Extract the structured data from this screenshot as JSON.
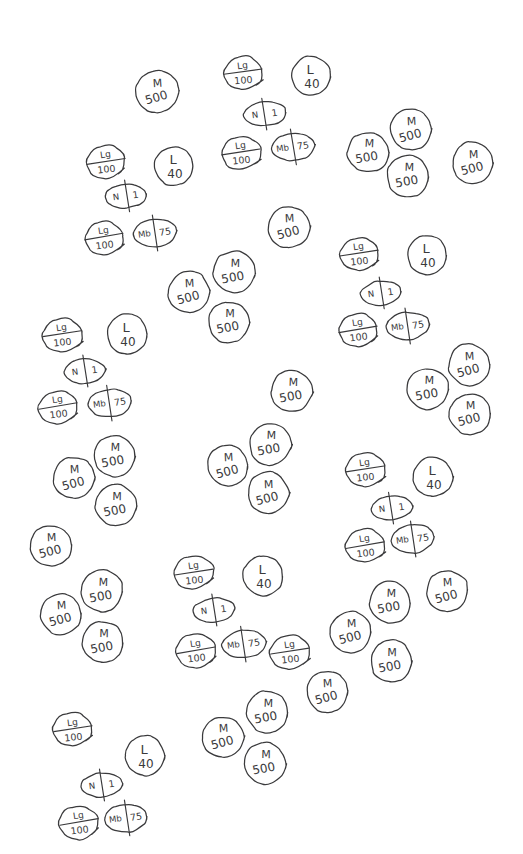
{
  "page": {
    "background_color": "#ffffff",
    "ink_color": "#3a3a3c",
    "width": 523,
    "height": 854
  },
  "token_types": {
    "m500": {
      "id": "m500",
      "shape": "circle",
      "top_label": "M",
      "bottom_label": "500"
    },
    "lg100": {
      "id": "lg100",
      "shape": "hexagon",
      "top_label": "Lg",
      "bottom_label": "100"
    },
    "l40": {
      "id": "l40",
      "shape": "circle",
      "top_label": "L",
      "bottom_label": "40"
    },
    "n1": {
      "id": "n1",
      "shape": "oval",
      "left_label": "N",
      "right_label": "1"
    },
    "mb75": {
      "id": "mb75",
      "shape": "oval",
      "left_label": "Mb",
      "right_label": "75"
    }
  },
  "legend": [
    {
      "type": "m500",
      "label": "M 500",
      "count": 33
    },
    {
      "type": "lg100",
      "label": "Lg 100",
      "count": 13
    },
    {
      "type": "l40",
      "label": "L 40",
      "count": 6
    },
    {
      "type": "n1",
      "label": "N 1",
      "count": 6
    },
    {
      "type": "mb75",
      "label": "Mb 75",
      "count": 6
    }
  ],
  "tokens": [
    {
      "type": "m500",
      "x": 157,
      "y": 92,
      "rx": 22,
      "ry": 21,
      "rot": -4
    },
    {
      "type": "lg100",
      "x": 243,
      "y": 73,
      "rx": 21,
      "ry": 18,
      "rot": -3
    },
    {
      "type": "l40",
      "x": 311,
      "y": 76,
      "rx": 20,
      "ry": 20,
      "rot": 0
    },
    {
      "type": "n1",
      "x": 265,
      "y": 114,
      "rx": 21,
      "ry": 12,
      "rot": -5
    },
    {
      "type": "lg100",
      "x": 241,
      "y": 153,
      "rx": 21,
      "ry": 18,
      "rot": -4
    },
    {
      "type": "mb75",
      "x": 293,
      "y": 147,
      "rx": 22,
      "ry": 14,
      "rot": -6
    },
    {
      "type": "m500",
      "x": 368,
      "y": 152,
      "rx": 21,
      "ry": 20,
      "rot": 3
    },
    {
      "type": "m500",
      "x": 411,
      "y": 130,
      "rx": 21,
      "ry": 21,
      "rot": -3
    },
    {
      "type": "m500",
      "x": 408,
      "y": 176,
      "rx": 21,
      "ry": 21,
      "rot": 2
    },
    {
      "type": "m500",
      "x": 473,
      "y": 163,
      "rx": 21,
      "ry": 21,
      "rot": -2
    },
    {
      "type": "lg100",
      "x": 106,
      "y": 162,
      "rx": 21,
      "ry": 18,
      "rot": -4
    },
    {
      "type": "l40",
      "x": 174,
      "y": 166,
      "rx": 20,
      "ry": 20,
      "rot": 0
    },
    {
      "type": "n1",
      "x": 126,
      "y": 196,
      "rx": 21,
      "ry": 12,
      "rot": -5
    },
    {
      "type": "lg100",
      "x": 104,
      "y": 238,
      "rx": 21,
      "ry": 18,
      "rot": -5
    },
    {
      "type": "mb75",
      "x": 155,
      "y": 233,
      "rx": 22,
      "ry": 14,
      "rot": -5
    },
    {
      "type": "m500",
      "x": 289,
      "y": 227,
      "rx": 21,
      "ry": 21,
      "rot": -3
    },
    {
      "type": "m500",
      "x": 234,
      "y": 272,
      "rx": 21,
      "ry": 21,
      "rot": 2
    },
    {
      "type": "m500",
      "x": 189,
      "y": 292,
      "rx": 21,
      "ry": 21,
      "rot": -3
    },
    {
      "type": "m500",
      "x": 229,
      "y": 322,
      "rx": 21,
      "ry": 21,
      "rot": 1
    },
    {
      "type": "lg100",
      "x": 359,
      "y": 254,
      "rx": 21,
      "ry": 18,
      "rot": -4
    },
    {
      "type": "l40",
      "x": 427,
      "y": 255,
      "rx": 20,
      "ry": 20,
      "rot": 0
    },
    {
      "type": "n1",
      "x": 381,
      "y": 293,
      "rx": 21,
      "ry": 12,
      "rot": -5
    },
    {
      "type": "lg100",
      "x": 358,
      "y": 330,
      "rx": 21,
      "ry": 18,
      "rot": -5
    },
    {
      "type": "mb75",
      "x": 408,
      "y": 326,
      "rx": 22,
      "ry": 14,
      "rot": -5
    },
    {
      "type": "m500",
      "x": 469,
      "y": 365,
      "rx": 21,
      "ry": 21,
      "rot": -3
    },
    {
      "type": "m500",
      "x": 428,
      "y": 389,
      "rx": 21,
      "ry": 21,
      "rot": 2
    },
    {
      "type": "m500",
      "x": 470,
      "y": 414,
      "rx": 21,
      "ry": 21,
      "rot": -2
    },
    {
      "type": "m500",
      "x": 292,
      "y": 391,
      "rx": 21,
      "ry": 21,
      "rot": 2
    },
    {
      "type": "lg100",
      "x": 62,
      "y": 335,
      "rx": 21,
      "ry": 18,
      "rot": -4
    },
    {
      "type": "l40",
      "x": 127,
      "y": 334,
      "rx": 20,
      "ry": 20,
      "rot": 0
    },
    {
      "type": "n1",
      "x": 85,
      "y": 371,
      "rx": 21,
      "ry": 12,
      "rot": -5
    },
    {
      "type": "lg100",
      "x": 58,
      "y": 407,
      "rx": 21,
      "ry": 18,
      "rot": -5
    },
    {
      "type": "mb75",
      "x": 110,
      "y": 403,
      "rx": 22,
      "ry": 14,
      "rot": -5
    },
    {
      "type": "m500",
      "x": 114,
      "y": 456,
      "rx": 21,
      "ry": 21,
      "rot": 2
    },
    {
      "type": "m500",
      "x": 74,
      "y": 478,
      "rx": 21,
      "ry": 21,
      "rot": -3
    },
    {
      "type": "m500",
      "x": 116,
      "y": 505,
      "rx": 21,
      "ry": 21,
      "rot": 1
    },
    {
      "type": "m500",
      "x": 51,
      "y": 546,
      "rx": 21,
      "ry": 21,
      "rot": -2
    },
    {
      "type": "m500",
      "x": 102,
      "y": 591,
      "rx": 21,
      "ry": 21,
      "rot": 2
    },
    {
      "type": "m500",
      "x": 61,
      "y": 614,
      "rx": 21,
      "ry": 21,
      "rot": -3
    },
    {
      "type": "m500",
      "x": 103,
      "y": 642,
      "rx": 21,
      "ry": 21,
      "rot": 1
    },
    {
      "type": "m500",
      "x": 228,
      "y": 466,
      "rx": 21,
      "ry": 21,
      "rot": -3
    },
    {
      "type": "m500",
      "x": 270,
      "y": 444,
      "rx": 21,
      "ry": 21,
      "rot": 2
    },
    {
      "type": "m500",
      "x": 268,
      "y": 493,
      "rx": 21,
      "ry": 21,
      "rot": -2
    },
    {
      "type": "lg100",
      "x": 365,
      "y": 470,
      "rx": 21,
      "ry": 18,
      "rot": -4
    },
    {
      "type": "l40",
      "x": 433,
      "y": 477,
      "rx": 20,
      "ry": 20,
      "rot": 0
    },
    {
      "type": "n1",
      "x": 392,
      "y": 508,
      "rx": 21,
      "ry": 12,
      "rot": -5
    },
    {
      "type": "lg100",
      "x": 365,
      "y": 546,
      "rx": 21,
      "ry": 18,
      "rot": -5
    },
    {
      "type": "mb75",
      "x": 413,
      "y": 539,
      "rx": 22,
      "ry": 14,
      "rot": -5
    },
    {
      "type": "m500",
      "x": 447,
      "y": 591,
      "rx": 21,
      "ry": 21,
      "rot": -3
    },
    {
      "type": "m500",
      "x": 390,
      "y": 602,
      "rx": 21,
      "ry": 21,
      "rot": 2
    },
    {
      "type": "m500",
      "x": 351,
      "y": 632,
      "rx": 21,
      "ry": 21,
      "rot": -2
    },
    {
      "type": "m500",
      "x": 391,
      "y": 661,
      "rx": 21,
      "ry": 21,
      "rot": 1
    },
    {
      "type": "m500",
      "x": 327,
      "y": 692,
      "rx": 21,
      "ry": 21,
      "rot": -3
    },
    {
      "type": "lg100",
      "x": 194,
      "y": 573,
      "rx": 21,
      "ry": 18,
      "rot": -4
    },
    {
      "type": "l40",
      "x": 263,
      "y": 576,
      "rx": 20,
      "ry": 20,
      "rot": 0
    },
    {
      "type": "n1",
      "x": 214,
      "y": 610,
      "rx": 21,
      "ry": 12,
      "rot": -5
    },
    {
      "type": "lg100",
      "x": 196,
      "y": 651,
      "rx": 21,
      "ry": 18,
      "rot": -5
    },
    {
      "type": "mb75",
      "x": 244,
      "y": 644,
      "rx": 22,
      "ry": 14,
      "rot": -5
    },
    {
      "type": "lg100",
      "x": 290,
      "y": 652,
      "rx": 21,
      "ry": 18,
      "rot": -4
    },
    {
      "type": "m500",
      "x": 267,
      "y": 712,
      "rx": 21,
      "ry": 21,
      "rot": 2
    },
    {
      "type": "m500",
      "x": 223,
      "y": 737,
      "rx": 21,
      "ry": 21,
      "rot": -3
    },
    {
      "type": "m500",
      "x": 265,
      "y": 763,
      "rx": 21,
      "ry": 21,
      "rot": 1
    },
    {
      "type": "lg100",
      "x": 73,
      "y": 730,
      "rx": 21,
      "ry": 18,
      "rot": -4
    },
    {
      "type": "l40",
      "x": 145,
      "y": 756,
      "rx": 20,
      "ry": 20,
      "rot": 0
    },
    {
      "type": "n1",
      "x": 102,
      "y": 785,
      "rx": 21,
      "ry": 12,
      "rot": -5
    },
    {
      "type": "lg100",
      "x": 79,
      "y": 823,
      "rx": 21,
      "ry": 18,
      "rot": -5
    },
    {
      "type": "mb75",
      "x": 126,
      "y": 818,
      "rx": 22,
      "ry": 14,
      "rot": -5
    }
  ]
}
